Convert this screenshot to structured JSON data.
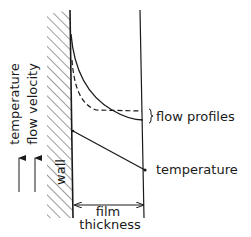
{
  "diagram": {
    "title": "",
    "labels": {
      "axis_temperature": "temperature",
      "axis_flow_velocity": "flow velocity",
      "wall": "wall",
      "flow_profiles": "flow profiles",
      "temperature": "temperature",
      "film_line1": "film",
      "film_line2": "thickness"
    },
    "colors": {
      "ink": "#1a1a1a",
      "background": "#ffffff"
    }
  }
}
